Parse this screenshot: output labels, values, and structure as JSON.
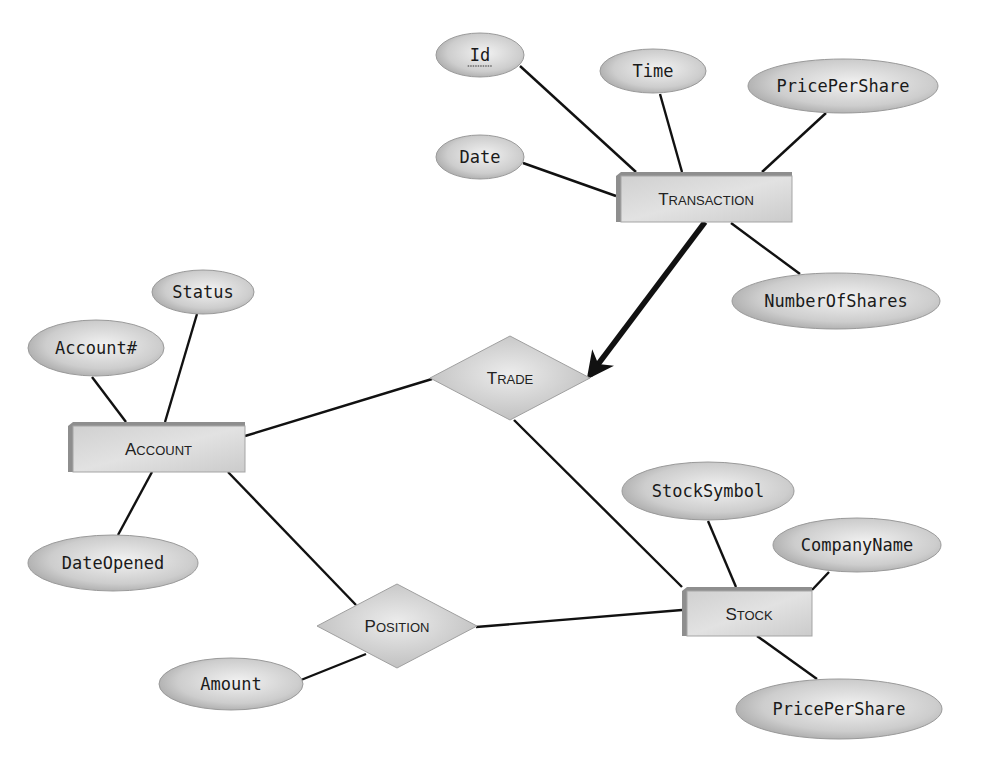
{
  "diagram": {
    "type": "entity-relationship",
    "entities": [
      {
        "id": "transaction",
        "label_first": "T",
        "label_rest": "RANSACTION",
        "x": 616,
        "y": 172,
        "w": 176,
        "h": 50
      },
      {
        "id": "account",
        "label_first": "A",
        "label_rest": "CCOUNT",
        "x": 68,
        "y": 422,
        "w": 177,
        "h": 50
      },
      {
        "id": "stock",
        "label_first": "S",
        "label_rest": "TOCK",
        "x": 682,
        "y": 587,
        "w": 130,
        "h": 49
      }
    ],
    "relationships": [
      {
        "id": "trade",
        "label_first": "T",
        "label_rest": "RADE",
        "cx": 510,
        "cy": 378,
        "rx": 80,
        "ry": 42
      },
      {
        "id": "position",
        "label_first": "P",
        "label_rest": "OSITION",
        "cx": 397,
        "cy": 626,
        "rx": 80,
        "ry": 42
      }
    ],
    "attributes": [
      {
        "id": "txn-id",
        "label": "Id",
        "key": true,
        "cx": 480,
        "cy": 55,
        "rx": 44,
        "ry": 22
      },
      {
        "id": "txn-time",
        "label": "Time",
        "cx": 653,
        "cy": 71,
        "rx": 53,
        "ry": 22
      },
      {
        "id": "txn-pricepershare",
        "label": "PricePerShare",
        "cx": 843,
        "cy": 86,
        "rx": 95,
        "ry": 27
      },
      {
        "id": "txn-date",
        "label": "Date",
        "cx": 480,
        "cy": 157,
        "rx": 44,
        "ry": 22
      },
      {
        "id": "txn-numberofshares",
        "label": "NumberOfShares",
        "cx": 836,
        "cy": 301,
        "rx": 104,
        "ry": 28
      },
      {
        "id": "acc-status",
        "label": "Status",
        "cx": 203,
        "cy": 292,
        "rx": 51,
        "ry": 22
      },
      {
        "id": "acc-accountnum",
        "label": "Account#",
        "cx": 96,
        "cy": 348,
        "rx": 68,
        "ry": 28
      },
      {
        "id": "acc-dateopened",
        "label": "DateOpened",
        "cx": 113,
        "cy": 563,
        "rx": 85,
        "ry": 28
      },
      {
        "id": "stk-stocksymbol",
        "label": "StockSymbol",
        "cx": 708,
        "cy": 491,
        "rx": 86,
        "ry": 29
      },
      {
        "id": "stk-companyname",
        "label": "CompanyName",
        "cx": 857,
        "cy": 545,
        "rx": 84,
        "ry": 27
      },
      {
        "id": "stk-pricepershare",
        "label": "PricePerShare",
        "cx": 839,
        "cy": 709,
        "rx": 103,
        "ry": 30
      },
      {
        "id": "pos-amount",
        "label": "Amount",
        "cx": 231,
        "cy": 684,
        "rx": 72,
        "ry": 26
      }
    ],
    "links": [
      {
        "from": "txn-id",
        "to": "transaction",
        "x1": 520,
        "y1": 66,
        "x2": 636,
        "y2": 172
      },
      {
        "from": "txn-time",
        "to": "transaction",
        "x1": 660,
        "y1": 94,
        "x2": 682,
        "y2": 172
      },
      {
        "from": "txn-pricepershare",
        "to": "transaction",
        "x1": 826,
        "y1": 113,
        "x2": 762,
        "y2": 172
      },
      {
        "from": "txn-date",
        "to": "transaction",
        "x1": 523,
        "y1": 163,
        "x2": 616,
        "y2": 196
      },
      {
        "from": "transaction",
        "to": "txn-numberofshares",
        "x1": 731,
        "y1": 223,
        "x2": 800,
        "y2": 274
      },
      {
        "from": "acc-status",
        "to": "account",
        "x1": 197,
        "y1": 314,
        "x2": 165,
        "y2": 422
      },
      {
        "from": "acc-accountnum",
        "to": "account",
        "x1": 92,
        "y1": 377,
        "x2": 126,
        "y2": 422
      },
      {
        "from": "account",
        "to": "acc-dateopened",
        "x1": 152,
        "y1": 472,
        "x2": 118,
        "y2": 535
      },
      {
        "from": "account",
        "to": "trade",
        "x1": 245,
        "y1": 436,
        "x2": 432,
        "y2": 379
      },
      {
        "from": "trade",
        "to": "stock",
        "x1": 514,
        "y1": 420,
        "x2": 682,
        "y2": 587
      },
      {
        "from": "account",
        "to": "position",
        "x1": 228,
        "y1": 472,
        "x2": 356,
        "y2": 605
      },
      {
        "from": "position",
        "to": "stock",
        "x1": 476,
        "y1": 627,
        "x2": 682,
        "y2": 610
      },
      {
        "from": "pos-amount",
        "to": "position",
        "x1": 301,
        "y1": 680,
        "x2": 366,
        "y2": 654
      },
      {
        "from": "stk-stocksymbol",
        "to": "stock",
        "x1": 708,
        "y1": 521,
        "x2": 736,
        "y2": 587
      },
      {
        "from": "stk-companyname",
        "to": "stock",
        "x1": 829,
        "y1": 572,
        "x2": 812,
        "y2": 590
      },
      {
        "from": "stock",
        "to": "stk-pricepershare",
        "x1": 757,
        "y1": 636,
        "x2": 817,
        "y2": 679
      }
    ],
    "arrow": {
      "from": "transaction",
      "to": "trade",
      "x1": 705,
      "y1": 222,
      "x2": 590,
      "y2": 375,
      "style": "bold-arrow"
    },
    "colors": {
      "fill_light": "#e6e6e6",
      "fill_mid": "#cfcfcf",
      "fill_dark": "#a8a8a8",
      "shadow": "#8a8a8a",
      "line": "#111111"
    }
  }
}
